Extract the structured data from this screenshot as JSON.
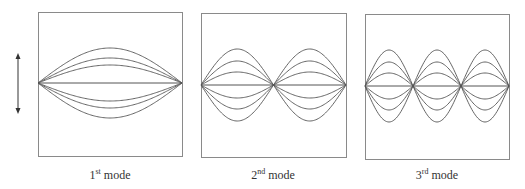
{
  "diagram": {
    "arrow": {
      "x": 18,
      "y1": 53,
      "y2": 114,
      "meaning": "transverse displacement"
    },
    "stroke_color": "#555555",
    "frame_color": "#8a8a8a",
    "amplitudes_mode1": [
      18,
      25,
      35
    ],
    "amplitudes_mode23": [
      13,
      24,
      36
    ],
    "panels": [
      {
        "mode": 1,
        "ordinal": "1",
        "suffix": "st",
        "word": "mode",
        "box": [
          38,
          12,
          182,
          156
        ],
        "center_y": 83,
        "loops": 1,
        "label_x": 110
      },
      {
        "mode": 2,
        "ordinal": "2",
        "suffix": "nd",
        "word": "mode",
        "box": [
          201,
          13,
          346,
          157
        ],
        "center_y": 85,
        "loops": 2,
        "label_x": 273
      },
      {
        "mode": 3,
        "ordinal": "3",
        "suffix": "rd",
        "word": "mode",
        "box": [
          365,
          14,
          509,
          159
        ],
        "center_y": 86,
        "loops": 3,
        "label_x": 437
      }
    ],
    "label_y": 168
  }
}
